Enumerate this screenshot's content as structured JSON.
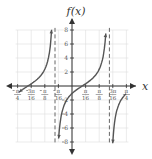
{
  "chart_data": {
    "type": "line",
    "title": "",
    "ylabel": "f(x)",
    "xlabel": "x",
    "function_description": "tangent-type function with period π/4",
    "xlim": [
      "-π/4",
      "π/4"
    ],
    "ylim": [
      -8,
      8
    ],
    "grid": true,
    "x_ticks": [
      {
        "value": -0.7854,
        "label_num": "π",
        "label_den": "4",
        "negative": true
      },
      {
        "value": -0.589,
        "label_num": "3π",
        "label_den": "16",
        "negative": true
      },
      {
        "value": -0.3927,
        "label_num": "π",
        "label_den": "8",
        "negative": true
      },
      {
        "value": -0.1963,
        "label_num": "π",
        "label_den": "16",
        "negative": true
      },
      {
        "value": 0.1963,
        "label_num": "π",
        "label_den": "16",
        "negative": false
      },
      {
        "value": 0.3927,
        "label_num": "π",
        "label_den": "8",
        "negative": false
      },
      {
        "value": 0.589,
        "label_num": "3π",
        "label_den": "16",
        "negative": false
      },
      {
        "value": 0.7854,
        "label_num": "π",
        "label_den": "4",
        "negative": false
      }
    ],
    "y_ticks": [
      {
        "value": 8,
        "label": "8"
      },
      {
        "value": 6,
        "label": "6"
      },
      {
        "value": 4,
        "label": "4"
      },
      {
        "value": 2,
        "label": "2"
      },
      {
        "value": -2,
        "label": "2"
      },
      {
        "value": -4,
        "label": "4"
      },
      {
        "value": -6,
        "label": "6"
      },
      {
        "value": -8,
        "label": "8"
      }
    ],
    "vertical_asymptotes": [
      "-5π/64",
      "11π/64"
    ],
    "period": "π/4",
    "zero_crossings": [
      "-13π/64",
      "3π/64"
    ],
    "series": [
      {
        "name": "branch-left",
        "x_range": [
          "-π/4",
          "-5π/64"
        ]
      },
      {
        "name": "branch-middle",
        "x_range": [
          "-5π/64",
          "11π/64"
        ]
      },
      {
        "name": "branch-right",
        "x_range": [
          "11π/64",
          "π/4"
        ]
      }
    ],
    "colors": {
      "curve": "#555555",
      "asymptote": "#666666",
      "grid": "#dddddd",
      "axis": "#333333"
    }
  }
}
